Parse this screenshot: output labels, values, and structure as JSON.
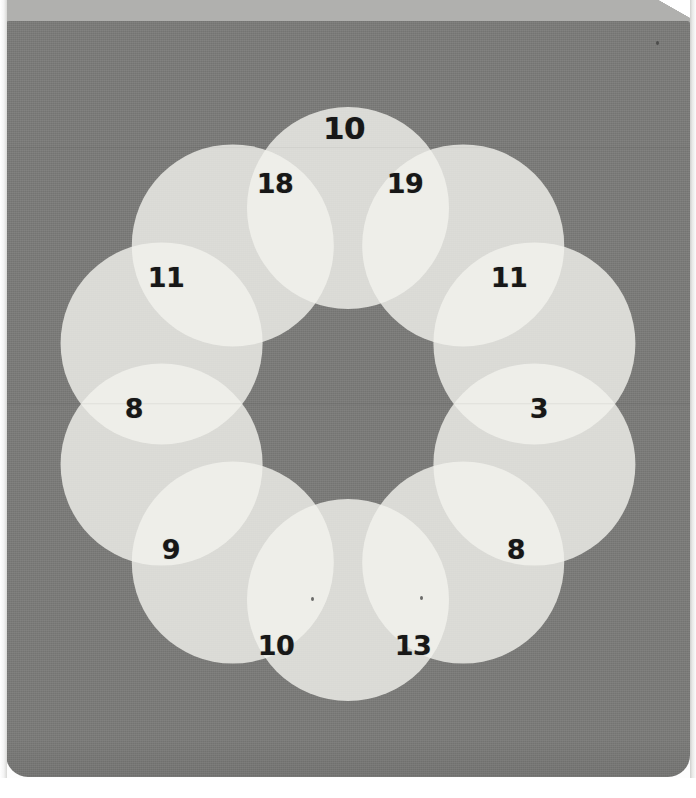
{
  "scene": {
    "title": "overlapping-circles-number-puzzle",
    "page_background": "#fdfdfd",
    "panel_color": "#7b7b79",
    "top_band_color": "#b0b0ae",
    "circle_fill": "#f2f2ee",
    "overlap_fill": "#b6b6b2",
    "number_color": "#171717"
  },
  "chart_data": {
    "type": "diagram",
    "title": "",
    "shape": "ring-of-overlapping-circles",
    "circle_count": 10,
    "circle_radius": 101,
    "ring_center": {
      "x": 348,
      "y": 404
    },
    "ring_radius": 196,
    "circles": [
      {
        "id": "c1",
        "angle_deg": -90,
        "cx": 348,
        "cy": 152
      },
      {
        "id": "c2",
        "angle_deg": -54,
        "cx": 507,
        "cy": 244
      },
      {
        "id": "c3",
        "angle_deg": -18,
        "cx": 568,
        "cy": 404
      },
      {
        "id": "c4",
        "angle_deg": 18,
        "cx": 507,
        "cy": 564
      },
      {
        "id": "c5",
        "angle_deg": 54,
        "cx": 348,
        "cy": 656
      },
      {
        "id": "c6",
        "angle_deg": 90,
        "cx": 189,
        "cy": 564
      },
      {
        "id": "c7",
        "angle_deg": 126,
        "cx": 128,
        "cy": 404
      },
      {
        "id": "c8",
        "angle_deg": 162,
        "cx": 189,
        "cy": 244
      },
      {
        "id": "c9",
        "angle_deg": 198,
        "cx": 348,
        "cy": 152
      },
      {
        "id": "c10",
        "angle_deg": 234,
        "cx": 348,
        "cy": 152
      }
    ],
    "labels": [
      {
        "id": "label-top",
        "text": "10",
        "x": 344,
        "y": 128,
        "size": "big",
        "region": "inside-top-circle"
      },
      {
        "id": "label-upper-left",
        "text": "18",
        "x": 275,
        "y": 183,
        "size": "small",
        "region": "overlap"
      },
      {
        "id": "label-upper-right",
        "text": "19",
        "x": 405,
        "y": 183,
        "size": "small",
        "region": "overlap"
      },
      {
        "id": "label-left-upper",
        "text": "11",
        "x": 166,
        "y": 277,
        "size": "small",
        "region": "overlap"
      },
      {
        "id": "label-right-upper",
        "text": "11",
        "x": 509,
        "y": 277,
        "size": "small",
        "region": "overlap"
      },
      {
        "id": "label-left-lower",
        "text": "8",
        "x": 134,
        "y": 408,
        "size": "small",
        "region": "overlap"
      },
      {
        "id": "label-right-lower",
        "text": "3",
        "x": 539,
        "y": 408,
        "size": "small",
        "region": "overlap"
      },
      {
        "id": "label-lower-left",
        "text": "9",
        "x": 171,
        "y": 549,
        "size": "small",
        "region": "overlap"
      },
      {
        "id": "label-lower-right",
        "text": "8",
        "x": 516,
        "y": 549,
        "size": "small",
        "region": "overlap"
      },
      {
        "id": "label-bottom-left",
        "text": "10",
        "x": 276,
        "y": 645,
        "size": "small",
        "region": "overlap"
      },
      {
        "id": "label-bottom-right",
        "text": "13",
        "x": 413,
        "y": 645,
        "size": "small",
        "region": "overlap"
      }
    ],
    "specks": [
      {
        "x": 656,
        "y": 41
      },
      {
        "x": 311,
        "y": 597
      },
      {
        "x": 420,
        "y": 596
      }
    ]
  }
}
